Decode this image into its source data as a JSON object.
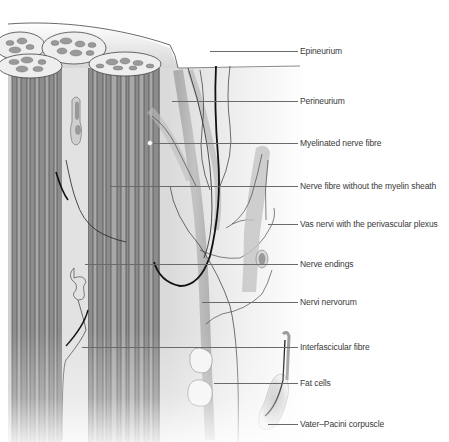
{
  "diagram": {
    "colors": {
      "fascicle_grey": "#8c8c8c",
      "fibre_dark": "#6e6e6e",
      "background_shade": "#d8d8d8",
      "nerve_black": "#111111",
      "label_text": "#3a3a3a",
      "leader_line": "#6a6a6a"
    },
    "labels": [
      {
        "id": "epineurium",
        "text": "Epineurium"
      },
      {
        "id": "perineurium",
        "text": "Perineurium"
      },
      {
        "id": "myelinated-nerve-fibre",
        "text": "Myelinated nerve  fibre"
      },
      {
        "id": "nerve-fibre-without-myelin",
        "text": "Nerve  fibre without the myelin sheath"
      },
      {
        "id": "vas-nervi",
        "text": "Vas nervi with the perivascular plexus"
      },
      {
        "id": "nerve-endings",
        "text": "Nerve endings"
      },
      {
        "id": "nervi-nervorum",
        "text": "Nervi nervorum"
      },
      {
        "id": "interfascicular-fibre",
        "text": "Interfascicular fibre"
      },
      {
        "id": "fat-cells",
        "text": "Fat cells"
      },
      {
        "id": "vater-pacini-corpuscle",
        "text": "Vater–Pacini corpuscle"
      }
    ]
  }
}
